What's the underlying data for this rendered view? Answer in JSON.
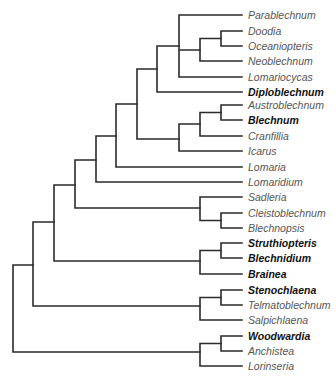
{
  "diagram": {
    "type": "phylogenetic-tree",
    "line_color": "#2b2b2b",
    "label_color": "#555555",
    "bold_label_color": "#111111",
    "taxa": [
      {
        "name": "Parablechnum",
        "bold": false,
        "y": 15
      },
      {
        "name": "Doodia",
        "bold": false,
        "y": 31
      },
      {
        "name": "Oceaniopteris",
        "bold": false,
        "y": 46
      },
      {
        "name": "Neoblechnum",
        "bold": false,
        "y": 61
      },
      {
        "name": "Lomariocycas",
        "bold": false,
        "y": 77
      },
      {
        "name": "Diploblechnum",
        "bold": true,
        "y": 92
      },
      {
        "name": "Austroblechnum",
        "bold": false,
        "y": 105
      },
      {
        "name": "Blechnum",
        "bold": true,
        "y": 120
      },
      {
        "name": "Cranfillia",
        "bold": false,
        "y": 136
      },
      {
        "name": "Icarus",
        "bold": false,
        "y": 151
      },
      {
        "name": "Lomaria",
        "bold": false,
        "y": 167
      },
      {
        "name": "Lomaridium",
        "bold": false,
        "y": 182
      },
      {
        "name": "Sadleria",
        "bold": false,
        "y": 197
      },
      {
        "name": "Cleistoblechnum",
        "bold": false,
        "y": 213
      },
      {
        "name": "Blechnopsis",
        "bold": false,
        "y": 228
      },
      {
        "name": "Struthiopteris",
        "bold": true,
        "y": 243
      },
      {
        "name": "Blechnidium",
        "bold": true,
        "y": 258
      },
      {
        "name": "Brainea",
        "bold": true,
        "y": 274
      },
      {
        "name": "Stenochlaena",
        "bold": true,
        "y": 290
      },
      {
        "name": "Telmatoblechnum",
        "bold": false,
        "y": 305
      },
      {
        "name": "Salpichlaena",
        "bold": false,
        "y": 320
      },
      {
        "name": "Woodwardia",
        "bold": true,
        "y": 336
      },
      {
        "name": "Anchistea",
        "bold": false,
        "y": 351
      },
      {
        "name": "Lorinseria",
        "bold": false,
        "y": 366
      }
    ]
  }
}
